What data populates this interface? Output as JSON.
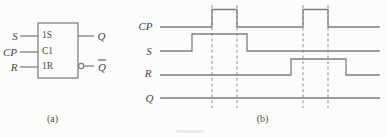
{
  "figure": {
    "background": "#fcfcfb",
    "line_color": "#7d7d7d",
    "dash_color": "#9a9a9a",
    "text_color": "#454545"
  },
  "symbol": {
    "caption": "(a)",
    "box": {
      "x": 38,
      "y": 23,
      "w": 40,
      "h": 55
    },
    "pin_in_x": 20,
    "pin_out_x": 94,
    "bubble_r": 2.6,
    "inputs": [
      {
        "label": "S",
        "inner": "1S",
        "y": 36
      },
      {
        "label": "CP",
        "inner": "C1",
        "y": 52
      },
      {
        "label": "R",
        "inner": "1R",
        "y": 67
      }
    ],
    "outputs": [
      {
        "label": "Q",
        "y": 36,
        "bubble": false,
        "overline": false
      },
      {
        "label": "Q",
        "y": 66,
        "bubble": true,
        "overline": true
      }
    ]
  },
  "timing": {
    "caption": "(b)",
    "x_start": 160,
    "x_end": 380,
    "dash_y": [
      5,
      108
    ],
    "dashed_x": [
      212,
      237,
      303,
      328
    ],
    "waveforms": [
      {
        "label": "CP",
        "low_y": 27,
        "high_y": 9.5,
        "start_level": 0,
        "changes": [
          [
            212,
            1
          ],
          [
            237,
            0
          ],
          [
            303,
            1
          ],
          [
            328,
            0
          ]
        ]
      },
      {
        "label": "S",
        "low_y": 51,
        "high_y": 34,
        "start_level": 0,
        "changes": [
          [
            192,
            1
          ],
          [
            247,
            0
          ]
        ]
      },
      {
        "label": "R",
        "low_y": 75,
        "high_y": 59,
        "start_level": 0,
        "changes": [
          [
            291,
            1
          ],
          [
            346,
            0
          ]
        ]
      },
      {
        "label": "Q",
        "low_y": 98,
        "high_y": 88,
        "start_level": 0,
        "changes": []
      }
    ]
  }
}
